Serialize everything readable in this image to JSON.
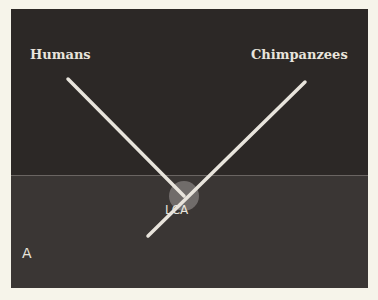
{
  "figure": {
    "panel_label": "A",
    "branches": [
      {
        "label": "Humans"
      },
      {
        "label": "Chimpanzees"
      }
    ],
    "node_label": "LCA",
    "colors": {
      "background": "#2c2826",
      "line": "#e8e4dc",
      "node": "#7a7674"
    }
  }
}
